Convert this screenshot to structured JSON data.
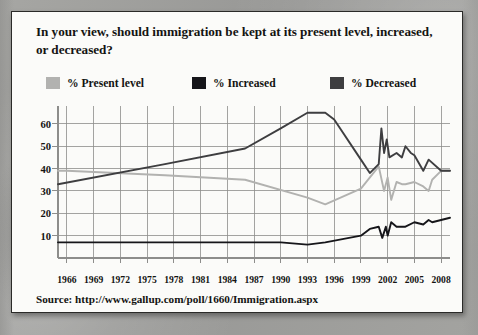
{
  "card": {
    "title": "In your view, should immigration be kept at its present level, increased, or decreased?",
    "source": "Source: http://www.gallup.com/poll/1660/Immigration.aspx"
  },
  "colors": {
    "present_level": "#b2b2b0",
    "increased": "#16161a",
    "decreased": "#3e3e40",
    "grid": "#8d8d8b",
    "text": "#141412",
    "card_background": "#fbfbf9",
    "card_border": "#2a2a28",
    "page_background": "#9e9e9c"
  },
  "legend": {
    "items": [
      {
        "label": "% Present level",
        "color": "#b2b2b0",
        "series": "present_level"
      },
      {
        "label": "% Increased",
        "color": "#16161a",
        "series": "increased"
      },
      {
        "label": "% Decreased",
        "color": "#3e3e40",
        "series": "decreased"
      }
    ]
  },
  "chart_data": {
    "type": "line",
    "title": "In your view, should immigration be kept at its present level, increased, or decreased?",
    "xlabel": "",
    "ylabel": "",
    "xlim": [
      1965,
      2009
    ],
    "ylim": [
      0,
      68
    ],
    "grid": true,
    "legend_position": "top",
    "y_ticks": [
      10,
      20,
      30,
      40,
      50,
      60
    ],
    "x_ticks": [
      1966,
      1969,
      1972,
      1975,
      1978,
      1981,
      1984,
      1987,
      1990,
      1993,
      1996,
      1999,
      2002,
      2005,
      2008
    ],
    "x_gridlines": [
      1966,
      1969,
      1972,
      1975,
      1978,
      1981,
      1984,
      1987,
      1990,
      1993,
      1996,
      1999,
      2002,
      2005,
      2008
    ],
    "series": [
      {
        "name": "% Present level",
        "color": "#b2b2b0",
        "points": [
          [
            1965,
            39
          ],
          [
            1966,
            39
          ],
          [
            1977,
            37
          ],
          [
            1986,
            35
          ],
          [
            1993,
            27
          ],
          [
            1995,
            24
          ],
          [
            1999,
            31
          ],
          [
            2001,
            41
          ],
          [
            2001.6,
            30
          ],
          [
            2002,
            36
          ],
          [
            2002.4,
            26
          ],
          [
            2003,
            34
          ],
          [
            2003.6,
            33
          ],
          [
            2004,
            33
          ],
          [
            2005,
            34
          ],
          [
            2006,
            32
          ],
          [
            2006.6,
            30
          ],
          [
            2007,
            35
          ],
          [
            2008,
            39
          ],
          [
            2009,
            39
          ]
        ]
      },
      {
        "name": "% Increased",
        "color": "#16161a",
        "points": [
          [
            1965,
            7
          ],
          [
            1977,
            7
          ],
          [
            1986,
            7
          ],
          [
            1990,
            7
          ],
          [
            1993,
            6
          ],
          [
            1995,
            7
          ],
          [
            1999,
            10
          ],
          [
            2000,
            13
          ],
          [
            2001,
            14
          ],
          [
            2001.4,
            9
          ],
          [
            2001.8,
            14
          ],
          [
            2002,
            10
          ],
          [
            2002.4,
            16
          ],
          [
            2003,
            14
          ],
          [
            2004,
            14
          ],
          [
            2005,
            16
          ],
          [
            2006,
            15
          ],
          [
            2006.6,
            17
          ],
          [
            2007,
            16
          ],
          [
            2008,
            17
          ],
          [
            2009,
            18
          ]
        ]
      },
      {
        "name": "% Decreased",
        "color": "#3e3e40",
        "points": [
          [
            1965,
            33
          ],
          [
            1977,
            42
          ],
          [
            1986,
            49
          ],
          [
            1990,
            58
          ],
          [
            1993,
            65
          ],
          [
            1995,
            65
          ],
          [
            1996,
            62
          ],
          [
            1999,
            44
          ],
          [
            2000,
            38
          ],
          [
            2001,
            42
          ],
          [
            2001.3,
            58
          ],
          [
            2001.6,
            47
          ],
          [
            2001.9,
            53
          ],
          [
            2002.2,
            45
          ],
          [
            2003,
            47
          ],
          [
            2003.6,
            45
          ],
          [
            2004,
            50
          ],
          [
            2004.6,
            47
          ],
          [
            2005,
            46
          ],
          [
            2006,
            39
          ],
          [
            2006.6,
            44
          ],
          [
            2008,
            39
          ],
          [
            2009,
            39
          ]
        ]
      }
    ]
  }
}
